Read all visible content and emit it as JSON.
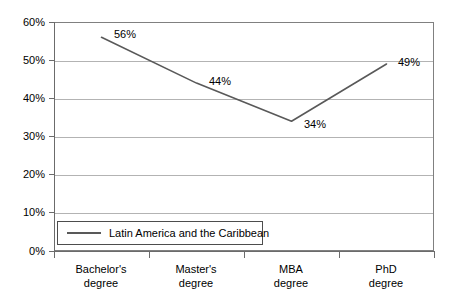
{
  "chart_data": {
    "type": "line",
    "title": "",
    "subtitle": "",
    "xlabel": "",
    "ylabel": "",
    "categories": [
      "Bachelor's degree",
      "Master's degree",
      "MBA degree",
      "PhD degree"
    ],
    "category_lines": [
      [
        "Bachelor's",
        "degree"
      ],
      [
        "Master's",
        "degree"
      ],
      [
        "MBA",
        "degree"
      ],
      [
        "PhD",
        "degree"
      ]
    ],
    "series": [
      {
        "name": "Latin America and the Caribbean",
        "values": [
          56,
          44,
          34,
          49
        ],
        "point_labels": [
          "56%",
          "44%",
          "34%",
          "49%"
        ],
        "color": "#595959"
      }
    ],
    "ylim": [
      0,
      60
    ],
    "ytick_values": [
      60,
      50,
      40,
      30,
      20,
      10,
      0
    ],
    "ytick_labels": [
      "60%",
      "50%",
      "40%",
      "30%",
      "20%",
      "10%",
      "0%"
    ],
    "grid": "horizontal",
    "grid_color": "#b3b3b3",
    "legend_position": "inside-bottom-left",
    "legend_entries": [
      "Latin America and the Caribbean"
    ],
    "axis_color": "#6b6b6b",
    "background": "#ffffff"
  },
  "legend": {
    "label": "Latin America and the Caribbean"
  },
  "axes": {
    "y": {
      "labels": [
        "60%",
        "50%",
        "40%",
        "30%",
        "20%",
        "10%",
        "0%"
      ]
    },
    "x": {
      "labels": [
        {
          "top": "Bachelor's",
          "bottom": "degree"
        },
        {
          "top": "Master's",
          "bottom": "degree"
        },
        {
          "top": "MBA",
          "bottom": "degree"
        },
        {
          "top": "PhD",
          "bottom": "degree"
        }
      ]
    }
  },
  "point_labels": {
    "p0": "56%",
    "p1": "44%",
    "p2": "34%",
    "p3": "49%"
  }
}
